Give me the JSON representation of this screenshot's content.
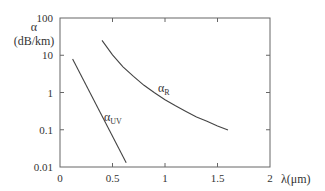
{
  "chart_data": {
    "type": "line",
    "title": "",
    "xlabel": "λ(μm)",
    "ylabel": "α",
    "ylabel_units": "(dB/km)",
    "xlim": [
      0,
      2
    ],
    "ylim": [
      0.01,
      100
    ],
    "yscale": "log",
    "grid": false,
    "legend": "none (inline curve labels)",
    "x_ticks": [
      0,
      0.5,
      1,
      1.5,
      2
    ],
    "x_tick_labels": [
      "0",
      "0.5",
      "1",
      "1.5",
      "2"
    ],
    "y_ticks": [
      0.01,
      0.1,
      1,
      10,
      100
    ],
    "y_tick_labels": [
      "0.01",
      "0.1",
      "1",
      "10",
      "100"
    ],
    "series": [
      {
        "name": "α_UV",
        "label_main": "α",
        "label_sub": "UV",
        "x": [
          0.12,
          0.63
        ],
        "y": [
          8,
          0.013
        ]
      },
      {
        "name": "α_R",
        "label_main": "α",
        "label_sub": "R",
        "x": [
          0.4,
          0.5,
          0.6,
          0.7,
          0.8,
          0.9,
          1.0,
          1.1,
          1.2,
          1.3,
          1.4,
          1.5,
          1.6
        ],
        "y": [
          25,
          10.2,
          4.9,
          2.7,
          1.56,
          0.98,
          0.64,
          0.44,
          0.31,
          0.22,
          0.17,
          0.126,
          0.098
        ]
      }
    ]
  }
}
